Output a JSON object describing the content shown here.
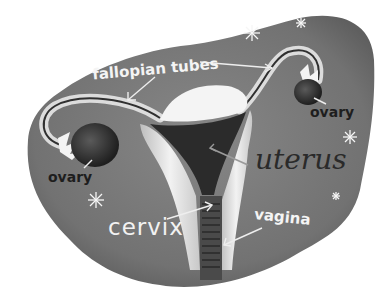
{
  "diagram": {
    "title": "",
    "labels": {
      "fallopian_tubes": "fallopian tubes",
      "ovary_right": "ovary",
      "ovary_left": "ovary",
      "uterus": "uterus",
      "cervix": "cervix",
      "vagina": "vagina"
    },
    "colors": {
      "background": "#ffffff",
      "blob": "#7a7a7a",
      "blob_shadow": "#5e5e5e",
      "organ_light": "#e6e6e6",
      "organ_dark": "#2e2e2e",
      "ovary": "#3a3a3a",
      "label_light": "#f4f4f4",
      "label_dark": "#1e1e1e"
    },
    "decorations": [
      "sparkle-star",
      "sparkle-star",
      "sparkle-star",
      "sparkle-star",
      "sparkle-star"
    ]
  }
}
